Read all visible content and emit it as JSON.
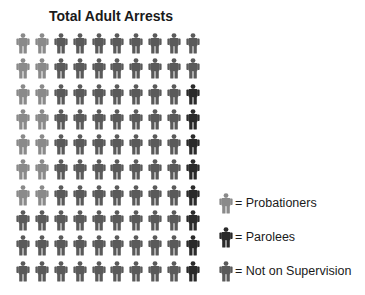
{
  "chart_data": {
    "type": "pictogram",
    "title": "Total Adult Arrests",
    "grid": {
      "rows": 10,
      "cols": 10
    },
    "units_total": 100,
    "series": [
      {
        "name": "Probationers",
        "value": 14,
        "color": "#8a8a8a"
      },
      {
        "name": "Parolees",
        "value": 8,
        "color": "#2a2a2a"
      },
      {
        "name": "Not on Supervision",
        "value": 78,
        "color": "#5a5a5a"
      }
    ],
    "layout_rows": [
      [
        "P",
        "P",
        "N",
        "N",
        "N",
        "N",
        "N",
        "N",
        "N",
        "N"
      ],
      [
        "P",
        "P",
        "N",
        "N",
        "N",
        "N",
        "N",
        "N",
        "N",
        "N"
      ],
      [
        "P",
        "P",
        "N",
        "N",
        "N",
        "N",
        "N",
        "N",
        "N",
        "R"
      ],
      [
        "P",
        "P",
        "N",
        "N",
        "N",
        "N",
        "N",
        "N",
        "N",
        "R"
      ],
      [
        "P",
        "P",
        "N",
        "N",
        "N",
        "N",
        "N",
        "N",
        "N",
        "R"
      ],
      [
        "P",
        "P",
        "N",
        "N",
        "N",
        "N",
        "N",
        "N",
        "N",
        "R"
      ],
      [
        "P",
        "P",
        "N",
        "N",
        "N",
        "N",
        "N",
        "N",
        "N",
        "R"
      ],
      [
        "N",
        "N",
        "N",
        "N",
        "N",
        "N",
        "N",
        "N",
        "N",
        "R"
      ],
      [
        "N",
        "N",
        "N",
        "N",
        "N",
        "N",
        "N",
        "N",
        "N",
        "R"
      ],
      [
        "N",
        "N",
        "N",
        "N",
        "N",
        "N",
        "N",
        "N",
        "N",
        "R"
      ]
    ],
    "legend": [
      {
        "key": "P",
        "label": "= Probationers",
        "color": "#8a8a8a"
      },
      {
        "key": "R",
        "label": "= Parolees",
        "color": "#2a2a2a"
      },
      {
        "key": "N",
        "label": "= Not on Supervision",
        "color": "#5a5a5a"
      }
    ],
    "legend_position": "bottom-right"
  }
}
